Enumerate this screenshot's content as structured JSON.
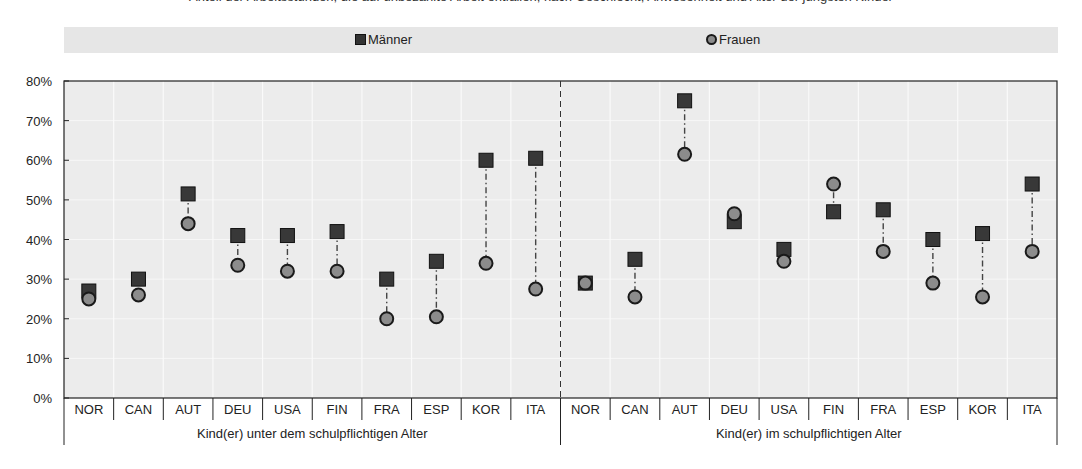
{
  "header": {
    "cut_title": "Anteil der Arbeitsstunden, die auf unbezahlte Arbeit entfallen, nach Geschlecht, Anwesenheit und Alter der jüngsten Kinder"
  },
  "legend": {
    "items": [
      {
        "label": "Männer",
        "marker": "square",
        "color": "#333333"
      },
      {
        "label": "Frauen",
        "marker": "circle",
        "color": "#8c8c8c"
      }
    ]
  },
  "chart_data": {
    "type": "dot-plot (dumbbell)",
    "title": "",
    "xlabel": "",
    "ylabel": "",
    "ylim": [
      0,
      80
    ],
    "yticks": [
      "0%",
      "10%",
      "20%",
      "30%",
      "40%",
      "50%",
      "60%",
      "70%",
      "80%"
    ],
    "grid": "vertical white category separators, light gray plot background",
    "legend_position": "top",
    "groups": [
      {
        "label": "Kind(er) unter dem schulpflichtigen Alter",
        "categories": [
          "NOR",
          "CAN",
          "AUT",
          "DEU",
          "USA",
          "FIN",
          "FRA",
          "ESP",
          "KOR",
          "ITA"
        ],
        "series": [
          {
            "name": "Männer",
            "values": [
              27,
              30,
              51.5,
              41,
              41,
              42,
              30,
              34.5,
              60,
              60.5
            ]
          },
          {
            "name": "Frauen",
            "values": [
              25,
              26,
              44,
              33.5,
              32,
              32,
              20,
              20.5,
              34,
              27.5
            ]
          }
        ]
      },
      {
        "label": "Kind(er) im schulpflichtigen Alter",
        "categories": [
          "NOR",
          "CAN",
          "AUT",
          "DEU",
          "USA",
          "FIN",
          "FRA",
          "ESP",
          "KOR",
          "ITA"
        ],
        "series": [
          {
            "name": "Männer",
            "values": [
              29,
              35,
              75,
              44.5,
              37.5,
              47,
              47.5,
              40,
              41.5,
              54
            ]
          },
          {
            "name": "Frauen",
            "values": [
              29,
              25.5,
              61.5,
              46.5,
              34.5,
              54,
              37,
              29,
              25.5,
              37
            ]
          }
        ]
      }
    ]
  }
}
